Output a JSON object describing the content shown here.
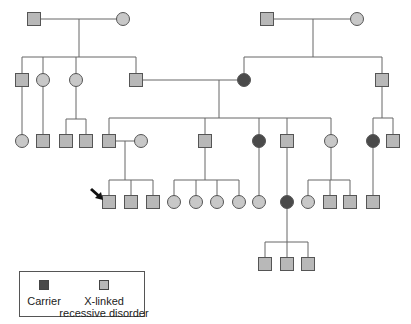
{
  "figure": {
    "type": "pedigree",
    "colors": {
      "line": "#666666",
      "affected_fill": "#b8b8b8",
      "unaffected_fill": "#c8c8c8",
      "carrier_fill": "#4a4a4a",
      "symbol_stroke": "#555555"
    }
  },
  "legend": {
    "carrier_label": "Carrier",
    "affected_label_line1": "X-linked",
    "affected_label_line2": "recessive disorder"
  },
  "individuals": [
    {
      "id": "I-1",
      "sex": "male",
      "status": "affected",
      "x": 34,
      "y": 19
    },
    {
      "id": "I-2",
      "sex": "female",
      "status": "unaffected",
      "x": 123,
      "y": 19
    },
    {
      "id": "I-3",
      "sex": "male",
      "status": "affected",
      "x": 267,
      "y": 19
    },
    {
      "id": "I-4",
      "sex": "female",
      "status": "unaffected",
      "x": 357,
      "y": 19
    },
    {
      "id": "II-1",
      "sex": "male",
      "status": "affected",
      "x": 22,
      "y": 80
    },
    {
      "id": "II-2",
      "sex": "female",
      "status": "unaffected",
      "x": 43,
      "y": 80
    },
    {
      "id": "II-3",
      "sex": "female",
      "status": "unaffected",
      "x": 76,
      "y": 80
    },
    {
      "id": "II-4",
      "sex": "male",
      "status": "affected",
      "x": 136,
      "y": 80
    },
    {
      "id": "II-5",
      "sex": "female",
      "status": "carrier",
      "x": 244,
      "y": 80
    },
    {
      "id": "II-6",
      "sex": "male",
      "status": "affected",
      "x": 382,
      "y": 80
    },
    {
      "id": "III-1",
      "sex": "female",
      "status": "unaffected",
      "x": 22,
      "y": 141
    },
    {
      "id": "III-2",
      "sex": "male",
      "status": "affected",
      "x": 43,
      "y": 141
    },
    {
      "id": "III-3",
      "sex": "male",
      "status": "affected",
      "x": 66,
      "y": 141
    },
    {
      "id": "III-4",
      "sex": "male",
      "status": "affected",
      "x": 86,
      "y": 141
    },
    {
      "id": "III-5",
      "sex": "male",
      "status": "affected",
      "x": 109,
      "y": 141
    },
    {
      "id": "III-6",
      "sex": "female",
      "status": "unaffected",
      "x": 141,
      "y": 141
    },
    {
      "id": "III-7",
      "sex": "male",
      "status": "affected",
      "x": 205,
      "y": 141
    },
    {
      "id": "III-8",
      "sex": "female",
      "status": "carrier",
      "x": 259,
      "y": 141
    },
    {
      "id": "III-9",
      "sex": "male",
      "status": "affected",
      "x": 287,
      "y": 141
    },
    {
      "id": "III-10",
      "sex": "female",
      "status": "unaffected",
      "x": 331,
      "y": 141
    },
    {
      "id": "III-11",
      "sex": "female",
      "status": "carrier",
      "x": 373,
      "y": 141
    },
    {
      "id": "III-12",
      "sex": "male",
      "status": "affected",
      "x": 393,
      "y": 141
    },
    {
      "id": "IV-1",
      "sex": "male",
      "status": "affected",
      "x": 109,
      "y": 202,
      "proband": true
    },
    {
      "id": "IV-2",
      "sex": "male",
      "status": "affected",
      "x": 131,
      "y": 202
    },
    {
      "id": "IV-3",
      "sex": "male",
      "status": "affected",
      "x": 153,
      "y": 202
    },
    {
      "id": "IV-4",
      "sex": "female",
      "status": "unaffected",
      "x": 174,
      "y": 202
    },
    {
      "id": "IV-5",
      "sex": "female",
      "status": "unaffected",
      "x": 196,
      "y": 202
    },
    {
      "id": "IV-6",
      "sex": "female",
      "status": "unaffected",
      "x": 217,
      "y": 202
    },
    {
      "id": "IV-7",
      "sex": "female",
      "status": "unaffected",
      "x": 239,
      "y": 202
    },
    {
      "id": "IV-8",
      "sex": "female",
      "status": "unaffected",
      "x": 259,
      "y": 202
    },
    {
      "id": "IV-9",
      "sex": "female",
      "status": "carrier",
      "x": 287,
      "y": 202
    },
    {
      "id": "IV-10",
      "sex": "female",
      "status": "unaffected",
      "x": 308,
      "y": 202
    },
    {
      "id": "IV-11",
      "sex": "male",
      "status": "affected",
      "x": 330,
      "y": 202
    },
    {
      "id": "IV-12",
      "sex": "male",
      "status": "affected",
      "x": 350,
      "y": 202
    },
    {
      "id": "IV-13",
      "sex": "male",
      "status": "affected",
      "x": 373,
      "y": 202
    },
    {
      "id": "V-1",
      "sex": "male",
      "status": "affected",
      "x": 265,
      "y": 264
    },
    {
      "id": "V-2",
      "sex": "male",
      "status": "affected",
      "x": 287,
      "y": 264
    },
    {
      "id": "V-3",
      "sex": "male",
      "status": "affected",
      "x": 308,
      "y": 264
    }
  ],
  "lines": [
    [
      34,
      19,
      123,
      19
    ],
    [
      79,
      19,
      79,
      57
    ],
    [
      22,
      57,
      136,
      57
    ],
    [
      22,
      57,
      22,
      80
    ],
    [
      43,
      57,
      43,
      80
    ],
    [
      76,
      57,
      76,
      80
    ],
    [
      136,
      57,
      136,
      80
    ],
    [
      267,
      19,
      357,
      19
    ],
    [
      313,
      19,
      313,
      57
    ],
    [
      244,
      57,
      382,
      57
    ],
    [
      244,
      57,
      244,
      80
    ],
    [
      382,
      57,
      382,
      80
    ],
    [
      136,
      80,
      244,
      80
    ],
    [
      219,
      80,
      219,
      118
    ],
    [
      109,
      118,
      331,
      118
    ],
    [
      109,
      118,
      109,
      141
    ],
    [
      205,
      118,
      205,
      141
    ],
    [
      259,
      118,
      259,
      141
    ],
    [
      287,
      118,
      287,
      141
    ],
    [
      331,
      118,
      331,
      141
    ],
    [
      22,
      80,
      22,
      141
    ],
    [
      43,
      80,
      43,
      141
    ],
    [
      76,
      80,
      76,
      119
    ],
    [
      66,
      119,
      86,
      119
    ],
    [
      66,
      119,
      66,
      141
    ],
    [
      86,
      119,
      86,
      141
    ],
    [
      382,
      80,
      382,
      118
    ],
    [
      373,
      118,
      393,
      118
    ],
    [
      373,
      118,
      373,
      141
    ],
    [
      393,
      118,
      393,
      141
    ],
    [
      109,
      141,
      141,
      141
    ],
    [
      125,
      141,
      125,
      180
    ],
    [
      109,
      180,
      153,
      180
    ],
    [
      109,
      180,
      109,
      202
    ],
    [
      131,
      180,
      131,
      202
    ],
    [
      153,
      180,
      153,
      202
    ],
    [
      205,
      141,
      205,
      180
    ],
    [
      174,
      180,
      239,
      180
    ],
    [
      174,
      180,
      174,
      202
    ],
    [
      196,
      180,
      196,
      202
    ],
    [
      217,
      180,
      217,
      202
    ],
    [
      239,
      180,
      239,
      202
    ],
    [
      259,
      141,
      259,
      202
    ],
    [
      287,
      141,
      287,
      202
    ],
    [
      331,
      141,
      331,
      180
    ],
    [
      308,
      180,
      350,
      180
    ],
    [
      308,
      180,
      308,
      202
    ],
    [
      330,
      180,
      330,
      202
    ],
    [
      350,
      180,
      350,
      202
    ],
    [
      373,
      141,
      373,
      202
    ],
    [
      287,
      202,
      287,
      242
    ],
    [
      265,
      242,
      308,
      242
    ],
    [
      265,
      242,
      265,
      264
    ],
    [
      287,
      242,
      287,
      264
    ],
    [
      308,
      242,
      308,
      264
    ]
  ],
  "proband_arrow": {
    "from": [
      91,
      189
    ],
    "to": [
      103,
      200
    ]
  }
}
